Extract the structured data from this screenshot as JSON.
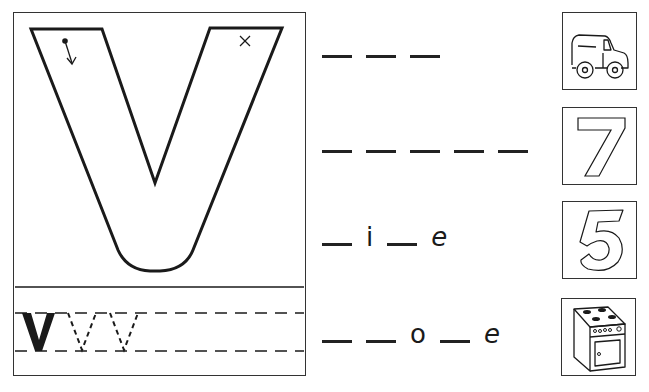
{
  "worksheet": {
    "letter": "V",
    "letter_panel": {
      "start_marker": "dot-arrow",
      "end_marker": "×",
      "practice_letters": [
        "V",
        "V",
        "V"
      ]
    },
    "rows": [
      {
        "id": "van",
        "pattern": [
          {
            "type": "blank"
          },
          {
            "type": "blank"
          },
          {
            "type": "blank"
          }
        ],
        "picture": "van-icon"
      },
      {
        "id": "seven",
        "pattern": [
          {
            "type": "blank"
          },
          {
            "type": "blank"
          },
          {
            "type": "blank"
          },
          {
            "type": "blank"
          },
          {
            "type": "blank"
          }
        ],
        "picture": "seven-icon",
        "picture_text": "7"
      },
      {
        "id": "five",
        "pattern": [
          {
            "type": "blank"
          },
          {
            "type": "char",
            "value": "i"
          },
          {
            "type": "blank"
          },
          {
            "type": "char",
            "value": "e",
            "italic": true
          }
        ],
        "picture": "five-icon",
        "picture_text": "5"
      },
      {
        "id": "stove",
        "pattern": [
          {
            "type": "blank"
          },
          {
            "type": "blank"
          },
          {
            "type": "char",
            "value": "o"
          },
          {
            "type": "blank"
          },
          {
            "type": "char",
            "value": "e",
            "italic": true
          }
        ],
        "picture": "stove-icon"
      }
    ],
    "colors": {
      "ink": "#1a1a1a",
      "paper": "#ffffff"
    }
  }
}
